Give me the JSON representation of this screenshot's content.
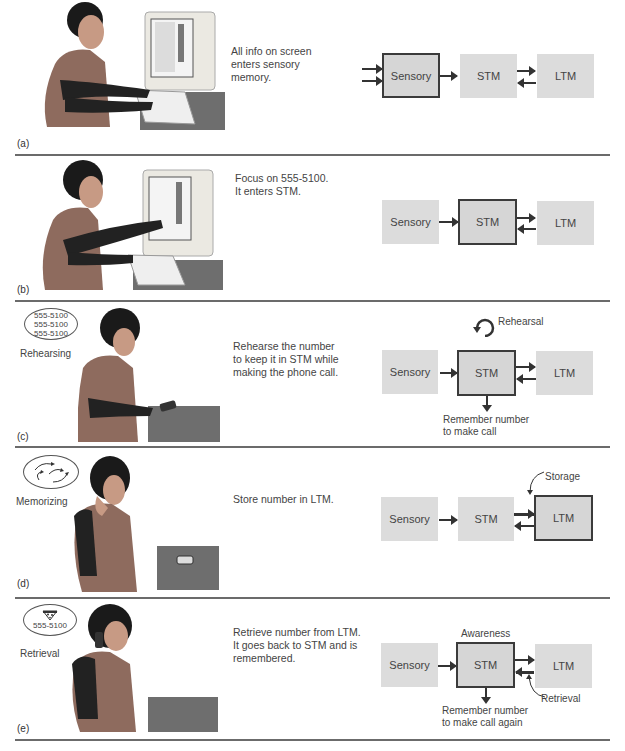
{
  "panels": [
    {
      "label": "(a)",
      "description": "All info on screen enters sensory memory.",
      "description_lines": [
        "All info on screen",
        "enters sensory",
        "memory."
      ],
      "scene": "woman-at-computer",
      "highlighted": "Sensory",
      "boxes": [
        "Sensory",
        "STM",
        "LTM"
      ]
    },
    {
      "label": "(b)",
      "description_lines": [
        "Focus on 555-5100.",
        "It enters STM."
      ],
      "scene": "woman-pointing-at-screen",
      "highlighted": "STM",
      "boxes": [
        "Sensory",
        "STM",
        "LTM"
      ]
    },
    {
      "label": "(c)",
      "side_label": "Rehearsing",
      "bubble_lines": [
        "555-5100",
        "555-5100",
        "555-5100"
      ],
      "description_lines": [
        "Rehearse the number",
        "to keep it in STM while",
        "making the phone call."
      ],
      "scene": "woman-dialing-phone",
      "highlighted": "STM",
      "boxes": [
        "Sensory",
        "STM",
        "LTM"
      ],
      "loop_label": "Rehearsal",
      "output_lines": [
        "Remember number",
        "to make call"
      ]
    },
    {
      "label": "(d)",
      "side_label": "Memorizing",
      "bubble_icon": "swirling-arrows-icon",
      "description_lines": [
        "Store number in LTM."
      ],
      "scene": "woman-thinking",
      "highlighted": "LTM",
      "boxes": [
        "Sensory",
        "STM",
        "LTM"
      ],
      "annotation": "Storage"
    },
    {
      "label": "(e)",
      "side_label": "Retrieval",
      "bubble_lines": [
        "555-5100"
      ],
      "bubble_icon": "pizza-icon",
      "description_lines": [
        "Retrieve number from LTM.",
        "It goes back to STM and is",
        "remembered."
      ],
      "scene": "woman-on-phone",
      "highlighted": "STM",
      "boxes": [
        "Sensory",
        "STM",
        "LTM"
      ],
      "top_label": "Awareness",
      "annotation": "Retrieval",
      "output_lines": [
        "Remember number",
        "to make call again"
      ]
    }
  ],
  "colors": {
    "box_fill": "#dcdcdc",
    "box_border": "#3b3b3b",
    "separator": "#6b6b6b"
  }
}
